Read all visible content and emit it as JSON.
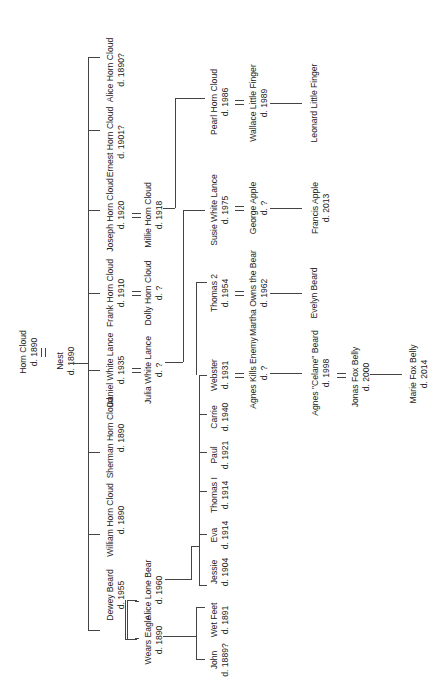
{
  "diagram": {
    "type": "family-tree",
    "orientation": "rotated-90-ccw",
    "line_color": "#444444",
    "text_color": "#222222",
    "background": "#ffffff"
  },
  "people": {
    "horn_cloud": {
      "name": "Horn Cloud",
      "death": "d. 1890"
    },
    "nest": {
      "name": "Nest",
      "death": "d. 1890"
    },
    "dewey_beard": {
      "name": "Dewey Beard",
      "death": "d. 1955"
    },
    "william_horn_cloud": {
      "name": "William Horn Cloud",
      "death": "d. 1890"
    },
    "sherman_horn_cloud": {
      "name": "Sherman Horn Cloud",
      "death": "d. 1890"
    },
    "daniel_white_lance": {
      "name": "Daniel White Lance",
      "death": "d. 1935"
    },
    "frank_horn_cloud": {
      "name": "Frank Horn Cloud",
      "death": "d. 1910"
    },
    "joseph_horn_cloud": {
      "name": "Joseph Horn Cloud",
      "death": "d. 1920"
    },
    "ernest_horn_cloud": {
      "name": "Ernest Horn Cloud",
      "death": "d. 1901?"
    },
    "alice_horn_cloud": {
      "name": "Alice Horn Cloud",
      "death": "d. 1890?"
    },
    "wears_eagle": {
      "name": "Wears Eagle",
      "death": "d. 1890"
    },
    "alice_lone_bear": {
      "name": "Alice Lone Bear",
      "death": "d. 1960"
    },
    "julia_white_lance": {
      "name": "Julia White Lance",
      "death": "d. ?"
    },
    "dolly_horn_cloud": {
      "name": "Dolly Horn Cloud",
      "death": "d. ?"
    },
    "millie_horn_cloud": {
      "name": "Millie Horn Cloud",
      "death": "d. 1918"
    },
    "john": {
      "name": "John",
      "death": "d. 1889?"
    },
    "wet_feet": {
      "name": "Wet Feet",
      "death": "d. 1891"
    },
    "jessie": {
      "name": "Jessie",
      "death": "d. 1904"
    },
    "eva": {
      "name": "Eva",
      "death": "d. 1914"
    },
    "thomas_i": {
      "name": "Thomas I",
      "death": "d. 1914"
    },
    "paul": {
      "name": "Paul",
      "death": "d. 1921"
    },
    "carrie": {
      "name": "Carrie",
      "death": "d. 1940"
    },
    "webster": {
      "name": "Webster",
      "death": "d. 1931"
    },
    "thomas_2": {
      "name": "Thomas 2",
      "death": "d. 1954"
    },
    "susie_white_lance": {
      "name": "Susie White Lance",
      "death": "d. 1975"
    },
    "pearl_horn_cloud": {
      "name": "Pearl Horn Cloud",
      "death": "d. 1986"
    },
    "agnes_kills_enemy": {
      "name": "Agnes Kills Enemy",
      "death": "d. ?"
    },
    "martha_owns_the_bear": {
      "name": "Martha Owns the Bear",
      "death": "d. 1962"
    },
    "george_apple": {
      "name": "George Apple",
      "death": "d. ?"
    },
    "wallace_little_finger": {
      "name": "Wallace Little Finger",
      "death": "d. 1989"
    },
    "agnes_celane_beard": {
      "name": "Agnes \"Celane\" Beard",
      "death": "d. 1998"
    },
    "evelyn_beard": {
      "name": "Evelyn Beard",
      "death": ""
    },
    "francis_apple": {
      "name": "Francis Apple",
      "death": "d. 2013"
    },
    "leonard_little_finger": {
      "name": "Leonard Little Finger",
      "death": ""
    },
    "jonas_fox_belly": {
      "name": "Jonas Fox Belly",
      "death": "d. 2000"
    },
    "marie_fox_belly": {
      "name": "Marie Fox Belly",
      "death": "d. 2014"
    }
  }
}
